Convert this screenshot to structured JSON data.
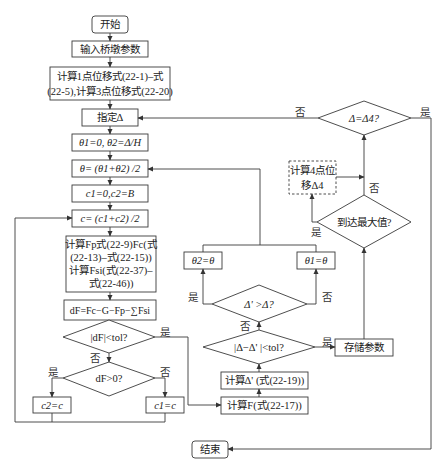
{
  "diagram": {
    "type": "flowchart",
    "nodes": {
      "start": "开始",
      "input_params": "输入桥墩参数",
      "calc_disp_1": "计算1点位移式(22-1)–式",
      "calc_disp_2": "(22-5),计算3点位移式(22-20)",
      "assign_delta": "指定Δ",
      "init_theta": "θ1=0, θ2=Δ/H",
      "theta_mid": "θ= (θ1+θ2) /2",
      "init_c": "c1=0,c2=B",
      "c_mid": "c= (c1+c2) /2",
      "calc_forces_1": "计算Fp式(22-9)Fc(式",
      "calc_forces_2": "(22-13)–式(22-15))",
      "calc_forces_3": "计算Fsi(式(22-37)–",
      "calc_forces_4": "式(22-46))",
      "dF": "dF=Fc−G−Fp−∑Fsi",
      "check_dF_tol": "|dF|<tol?",
      "check_dF_pos": "dF>0?",
      "c2_eq_c": "c2=c",
      "c1_eq_c": "c1=c",
      "calc_F": "计算F(式(22-17))",
      "calc_delta_prime": "计算Δ' (式(22-19))",
      "check_delta_tol": "|Δ−Δ' |<tol?",
      "check_delta_gt": "Δ' >Δ?",
      "theta2_eq": "θ2=θ",
      "theta1_eq": "θ1=θ",
      "store_params": "存储参数",
      "reach_max": "到达最大值?",
      "calc_disp_4_1": "计算4点位",
      "calc_disp_4_2": "移Δ4",
      "check_delta4": "Δ=Δ4?",
      "end": "结束"
    },
    "edge_labels": {
      "yes": "是",
      "no": "否"
    },
    "colors": {
      "line": "#3a3a3a",
      "text": "#222222",
      "background": "#ffffff"
    }
  }
}
